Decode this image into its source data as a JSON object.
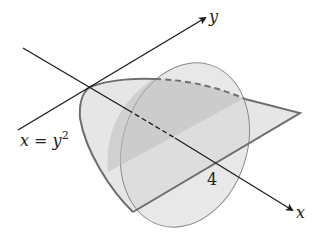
{
  "diagram": {
    "labels": {
      "y_axis": "y",
      "x_axis": "x",
      "curve_equation_lhs": "x = y",
      "curve_equation_exp": "2",
      "x_intercept": "4"
    },
    "colors": {
      "axis": "#1a1a1a",
      "outline": "#6e6e6e",
      "light_fill": "#e3e3e3",
      "ellipse_fill": "#d9d9d9",
      "dark_fill": "#c4c4c4"
    }
  }
}
